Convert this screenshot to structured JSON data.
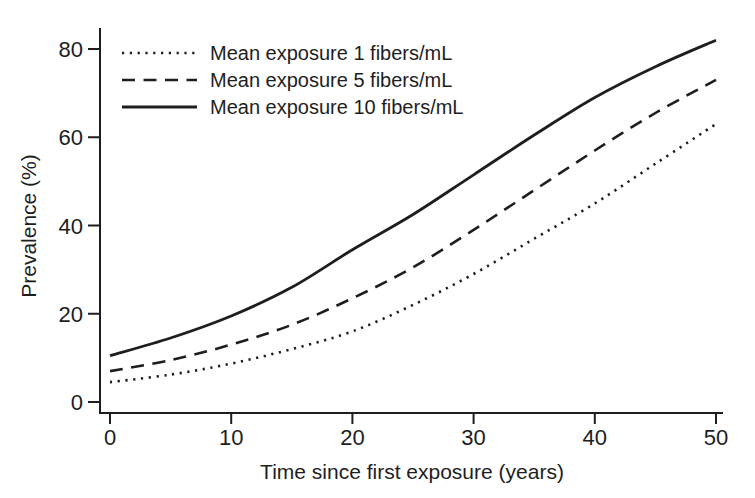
{
  "figure": {
    "background": "#ffffff",
    "ink": "#1e1e1e"
  },
  "chart_data": {
    "type": "line",
    "title": "",
    "xlabel": "Time since first exposure (years)",
    "ylabel": "Prevalence (%)",
    "xlim": [
      0,
      50
    ],
    "ylim": [
      0,
      80
    ],
    "xticks": [
      0,
      10,
      20,
      30,
      40,
      50
    ],
    "yticks": [
      0,
      20,
      40,
      60,
      80
    ],
    "grid": false,
    "legend_position": "top-left-inside",
    "x": [
      0,
      5,
      10,
      15,
      20,
      25,
      30,
      35,
      40,
      45,
      50
    ],
    "series": [
      {
        "name": "Mean exposure 1 fibers/mL",
        "line_style": "dotted",
        "color": "#1e1e1e",
        "values": [
          4.5,
          6.2,
          8.7,
          12,
          16,
          22,
          29,
          37,
          45,
          54,
          63
        ]
      },
      {
        "name": "Mean exposure 5 fibers/mL",
        "line_style": "dashed",
        "color": "#1e1e1e",
        "values": [
          7,
          9.5,
          13,
          17.5,
          23.5,
          30.5,
          39,
          48,
          57,
          65.5,
          73
        ]
      },
      {
        "name": "Mean exposure 10 fibers/mL",
        "line_style": "solid",
        "color": "#1e1e1e",
        "values": [
          10.5,
          14.5,
          19.5,
          26,
          34.5,
          42.5,
          51.5,
          60.5,
          69,
          76,
          82
        ]
      }
    ]
  }
}
